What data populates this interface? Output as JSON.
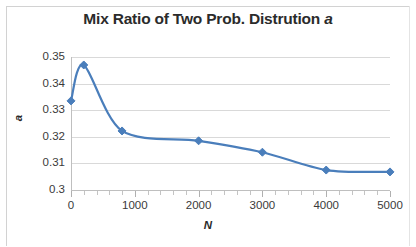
{
  "chart_data": {
    "type": "line",
    "title": "Mix Ratio of Two Prob. Distrution a",
    "title_main": "Mix Ratio of Two Prob. Distrution ",
    "title_italic": "a",
    "xlabel": "N",
    "ylabel": "a",
    "xlim": [
      0,
      5000
    ],
    "ylim": [
      0.3,
      0.35
    ],
    "grid": true,
    "legend": null,
    "series_color": "#4a7ebb",
    "marker": "diamond",
    "x_ticks": [
      "0",
      "1000",
      "2000",
      "3000",
      "4000",
      "5000"
    ],
    "x_tick_values": [
      0,
      1000,
      2000,
      3000,
      4000,
      5000
    ],
    "y_ticks": [
      "0.35",
      "0.34",
      "0.33",
      "0.32",
      "0.31",
      "0.3"
    ],
    "y_tick_values": [
      0.35,
      0.34,
      0.33,
      0.32,
      0.31,
      0.3
    ],
    "x": [
      0,
      200,
      800,
      2000,
      3000,
      4000,
      5000
    ],
    "values": [
      0.3335,
      0.347,
      0.3222,
      0.3185,
      0.3142,
      0.3075,
      0.3068
    ],
    "points": [
      {
        "x": 0,
        "y": 0.3335
      },
      {
        "x": 200,
        "y": 0.347
      },
      {
        "x": 800,
        "y": 0.3222
      },
      {
        "x": 2000,
        "y": 0.3185
      },
      {
        "x": 3000,
        "y": 0.3142
      },
      {
        "x": 4000,
        "y": 0.3075
      },
      {
        "x": 5000,
        "y": 0.3068
      }
    ]
  }
}
